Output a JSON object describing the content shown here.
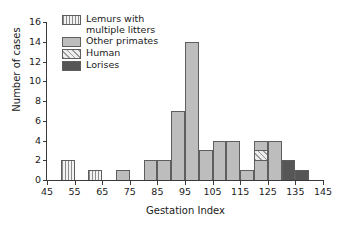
{
  "chart_data": {
    "type": "bar",
    "title": "",
    "xlabel": "Gestation Index",
    "ylabel": "Number of cases",
    "xlim": [
      45,
      145
    ],
    "ylim": [
      0,
      16
    ],
    "xticks": [
      45,
      55,
      65,
      75,
      85,
      95,
      105,
      115,
      125,
      135,
      145
    ],
    "yticks": [
      0,
      2,
      4,
      6,
      8,
      10,
      12,
      14,
      16
    ],
    "grid": false,
    "bin_width": 5,
    "legend_position": "top-left",
    "series": [
      {
        "name": "Lemurs with\nmultiple litters",
        "key": "lemurs",
        "pattern": "vertical-lines",
        "color": "#f2f2f2"
      },
      {
        "name": "Other primates",
        "key": "other",
        "pattern": "solid",
        "color": "#bdbdbd"
      },
      {
        "name": "Human",
        "key": "human",
        "pattern": "diagonal-hatch",
        "color": "#ededed"
      },
      {
        "name": "Lorises",
        "key": "lorises",
        "pattern": "solid-dark",
        "color": "#565656"
      }
    ],
    "bins": [
      {
        "x0": 50,
        "x1": 55,
        "total": 2,
        "segments": [
          {
            "key": "lemurs",
            "from": 0,
            "to": 2
          }
        ]
      },
      {
        "x0": 60,
        "x1": 65,
        "total": 1,
        "segments": [
          {
            "key": "lemurs",
            "from": 0,
            "to": 1
          }
        ]
      },
      {
        "x0": 70,
        "x1": 75,
        "total": 1,
        "segments": [
          {
            "key": "other",
            "from": 0,
            "to": 1
          }
        ]
      },
      {
        "x0": 80,
        "x1": 85,
        "total": 2,
        "segments": [
          {
            "key": "other",
            "from": 0,
            "to": 2
          }
        ]
      },
      {
        "x0": 85,
        "x1": 90,
        "total": 2,
        "segments": [
          {
            "key": "other",
            "from": 0,
            "to": 2
          }
        ]
      },
      {
        "x0": 90,
        "x1": 95,
        "total": 7,
        "segments": [
          {
            "key": "other",
            "from": 0,
            "to": 7
          }
        ]
      },
      {
        "x0": 95,
        "x1": 100,
        "total": 14,
        "segments": [
          {
            "key": "other",
            "from": 0,
            "to": 14
          }
        ]
      },
      {
        "x0": 100,
        "x1": 105,
        "total": 3,
        "segments": [
          {
            "key": "other",
            "from": 0,
            "to": 3
          }
        ]
      },
      {
        "x0": 105,
        "x1": 110,
        "total": 4,
        "segments": [
          {
            "key": "other",
            "from": 0,
            "to": 4
          }
        ]
      },
      {
        "x0": 110,
        "x1": 115,
        "total": 4,
        "segments": [
          {
            "key": "other",
            "from": 0,
            "to": 4
          }
        ]
      },
      {
        "x0": 115,
        "x1": 120,
        "total": 1,
        "segments": [
          {
            "key": "other",
            "from": 0,
            "to": 1
          }
        ]
      },
      {
        "x0": 120,
        "x1": 125,
        "total": 4,
        "segments": [
          {
            "key": "other",
            "from": 0,
            "to": 2
          },
          {
            "key": "human",
            "from": 2,
            "to": 3
          },
          {
            "key": "other",
            "from": 3,
            "to": 4
          }
        ]
      },
      {
        "x0": 125,
        "x1": 130,
        "total": 4,
        "segments": [
          {
            "key": "other",
            "from": 0,
            "to": 4
          }
        ]
      },
      {
        "x0": 130,
        "x1": 135,
        "total": 2,
        "segments": [
          {
            "key": "lorises",
            "from": 0,
            "to": 2
          }
        ]
      },
      {
        "x0": 135,
        "x1": 140,
        "total": 1,
        "segments": [
          {
            "key": "lorises",
            "from": 0,
            "to": 1
          }
        ]
      }
    ]
  }
}
